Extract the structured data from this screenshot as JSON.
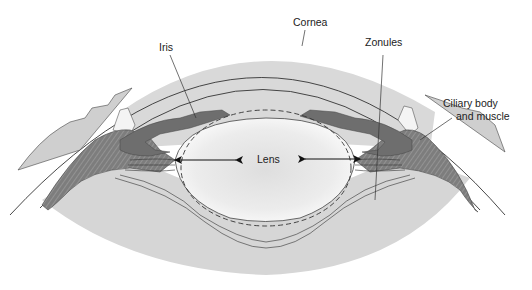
{
  "diagram": {
    "labels": {
      "cornea": "Cornea",
      "iris": "Iris",
      "zonules": "Zonules",
      "ciliary_line1": "Ciliary body",
      "ciliary_line2": "and muscle",
      "lens": "Lens"
    },
    "colors": {
      "background": "#ffffff",
      "anterior_chamber": "#d9d9d9",
      "vitreous": "#d6d6d6",
      "iris": "#6e6e6e",
      "ciliary": "#7a7a7a",
      "lens_center": "#e2e2e2",
      "lens_edge": "#f7f7f7",
      "sclera_tissue": "#cfcfcf",
      "stroke": "#333333"
    }
  }
}
